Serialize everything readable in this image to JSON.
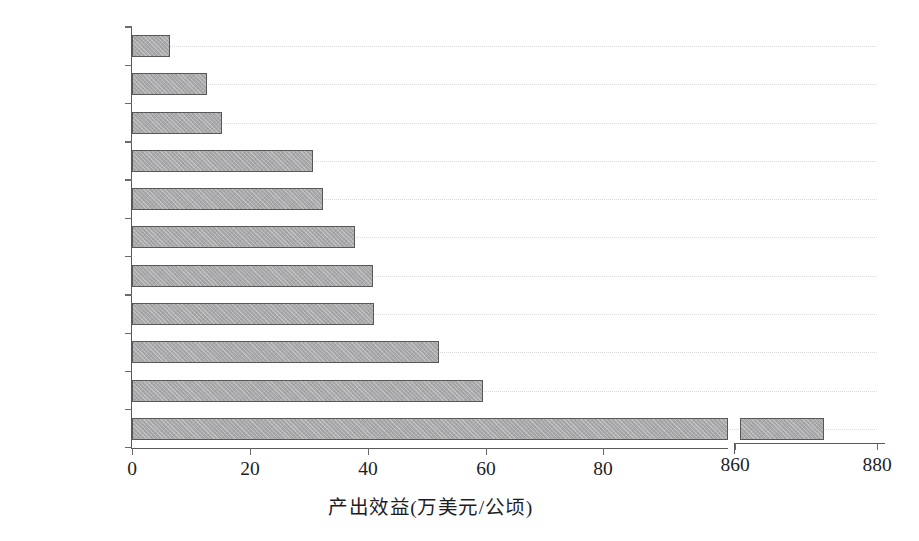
{
  "chart_data": {
    "type": "bar",
    "orientation": "horizontal",
    "title": "",
    "xlabel": "产出效益(万美元/公顷)",
    "ylabel": "",
    "categories": [
      "柬埔寨",
      "缅甸",
      "越南",
      "东帝汶",
      "老挝",
      "印度尼西亚",
      "文莱",
      "马来西亚",
      "泰国",
      "菲律宾",
      "新加坡"
    ],
    "values": [
      6.4,
      12.7,
      15.3,
      30.7,
      32.4,
      37.8,
      40.8,
      41.1,
      52.0,
      59.5,
      872.5
    ],
    "xticks": [
      0,
      20,
      40,
      60,
      80,
      860,
      880
    ],
    "xtick_labels": [
      "0",
      "20",
      "40",
      "60",
      "80",
      "860",
      "880"
    ],
    "axis_break": {
      "present": true,
      "after_value": 80,
      "resume_value": 860
    },
    "xlim_segment1": [
      0,
      85
    ],
    "xlim_segment2": [
      858,
      880
    ],
    "grid": "dotted-horizontal",
    "legend": "none",
    "bar_color": "#a9a9ab",
    "bar_edge_color": "#585859",
    "axis_color": "#59595c",
    "grid_color": "#dadadd",
    "background": "#ffffff"
  },
  "series_rows": [
    {
      "label": "柬埔寨",
      "value": 6.4
    },
    {
      "label": "缅甸",
      "value": 12.7
    },
    {
      "label": "越南",
      "value": 15.3
    },
    {
      "label": "东帝汶",
      "value": 30.7
    },
    {
      "label": "老挝",
      "value": 32.4
    },
    {
      "label": "印度尼西亚",
      "value": 37.8
    },
    {
      "label": "文莱",
      "value": 40.8
    },
    {
      "label": "马来西亚",
      "value": 41.1
    },
    {
      "label": "泰国",
      "value": 52.0
    },
    {
      "label": "菲律宾",
      "value": 59.5
    },
    {
      "label": "新加坡",
      "value": 872.5
    }
  ],
  "xaxis": {
    "title": "产出效益(万美元/公顷)",
    "ticks": [
      {
        "label": "0",
        "x": 132,
        "side": "left"
      },
      {
        "label": "20",
        "x": 250,
        "side": "left"
      },
      {
        "label": "40",
        "x": 368,
        "side": "left"
      },
      {
        "label": "60",
        "x": 486,
        "side": "left"
      },
      {
        "label": "80",
        "x": 603,
        "side": "left"
      },
      {
        "label": "860",
        "x": 735,
        "side": "right"
      },
      {
        "label": "880",
        "x": 877,
        "side": "right"
      }
    ]
  }
}
